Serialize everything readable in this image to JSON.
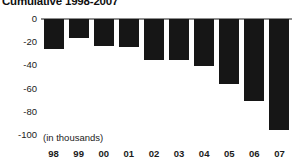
{
  "chart_data": {
    "type": "bar",
    "title": "Cumulative 1998-2007",
    "xlabel": "",
    "ylabel": "",
    "units_note": "(in thousands)",
    "categories": [
      "98",
      "99",
      "00",
      "01",
      "02",
      "03",
      "04",
      "05",
      "06",
      "07"
    ],
    "values": [
      -25,
      -16,
      -22,
      -23,
      -34,
      -34,
      -39,
      -54,
      -68,
      -92
    ],
    "ylim": [
      -100,
      0
    ],
    "yticks": [
      0,
      -20,
      -40,
      -60,
      -80,
      -100
    ],
    "ytick_labels": [
      "0",
      "-20",
      "-40",
      "-60",
      "-80",
      "-100"
    ],
    "grid": false,
    "legend": null,
    "bar_color": "#161616",
    "zero_line_color": "#8d8d8d",
    "background_color": "#ffffff",
    "text_color": "#1b1b1b"
  }
}
